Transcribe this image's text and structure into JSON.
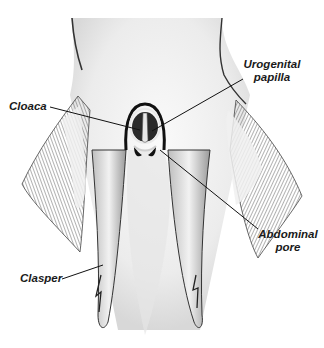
{
  "figure": {
    "colors": {
      "background": "#ffffff",
      "ink": "#1a1a1a",
      "shading": "#8a8a8a",
      "light_shading": "#d4d4d4"
    }
  },
  "labels": {
    "cloaca": "Cloaca",
    "urogenital_line1": "Urogenital",
    "urogenital_line2": "papilla",
    "abdominal_line1": "Abdominal",
    "abdominal_line2": "pore",
    "clasper": "Clasper"
  },
  "leaders": {
    "cloaca": {
      "x1": 50,
      "y1": 107,
      "x2": 140,
      "y2": 130
    },
    "urogenital": {
      "x1": 243,
      "y1": 79,
      "x2": 152,
      "y2": 131
    },
    "abdominal": {
      "x1": 258,
      "y1": 229,
      "x2": 160,
      "y2": 150
    },
    "clasper": {
      "x1": 62,
      "y1": 279,
      "x2": 103,
      "y2": 265
    }
  }
}
